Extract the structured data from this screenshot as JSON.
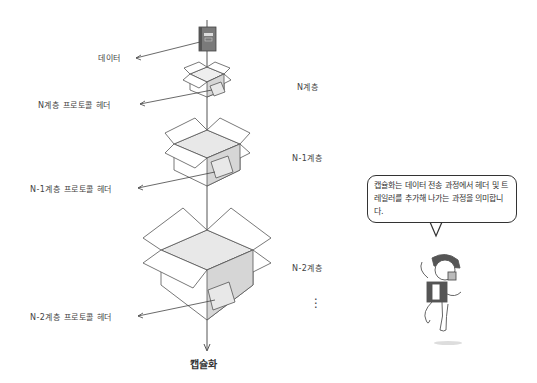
{
  "diagram": {
    "title": "캡슐화",
    "data_label": "데이터",
    "headers": [
      {
        "label": "N계층 프로토콜 헤더"
      },
      {
        "label": "N-1계층 프로토콜 헤더"
      },
      {
        "label": "N-2계층 프로토콜 헤더"
      }
    ],
    "layers": [
      {
        "label": "N계층"
      },
      {
        "label": "N-1계층"
      },
      {
        "label": "N-2계층"
      }
    ],
    "ellipsis": "⋮"
  },
  "speech_bubble": {
    "text": "캡슐화는 데이터 전송 과정에서 헤더 및 트레일러를 추가해 나가는 과정을 의미합니다."
  },
  "colors": {
    "line": "#444444",
    "box_inner": "#e6e6e6",
    "box_side": "#d0d0d0",
    "book": "#7a7a7a"
  }
}
